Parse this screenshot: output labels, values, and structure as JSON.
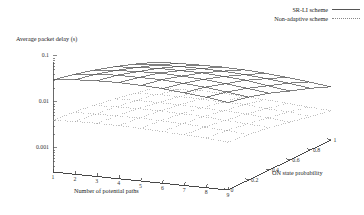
{
  "chart_data": {
    "type": "line",
    "plot_style": "3d-surface-mesh",
    "title": "",
    "zlabel": "Average packet delay (s)",
    "xlabel": "Number of potential paths",
    "ylabel": "ON state probability",
    "zscale": "log",
    "zlim": [
      0.0003,
      0.12
    ],
    "ztick_labels": [
      "0.1",
      "0.01",
      "0.001"
    ],
    "ztick_values": [
      0.1,
      0.01,
      0.001
    ],
    "xtick_labels": [
      "1",
      "2",
      "3",
      "4",
      "5",
      "6",
      "7",
      "8",
      "9"
    ],
    "xtick_values": [
      1,
      2,
      3,
      4,
      5,
      6,
      7,
      8,
      9
    ],
    "ytick_labels": [
      "0",
      "0.2",
      "0.4",
      "0.6",
      "0.8",
      "1"
    ],
    "ytick_values": [
      0,
      0.2,
      0.4,
      0.6,
      0.8,
      1
    ],
    "grid": false,
    "legend_position": "top-right",
    "legend": [
      "SR-LI scheme",
      "Non-adaptive scheme"
    ],
    "x": [
      1,
      2,
      3,
      4,
      5,
      6,
      7,
      8,
      9
    ],
    "y": [
      0,
      0.2,
      0.4,
      0.6,
      0.8,
      1
    ],
    "series": [
      {
        "name": "SR-LI scheme",
        "style": "solid",
        "color": "#555555",
        "z": [
          [
            0.03,
            0.024,
            0.018,
            0.013,
            0.009,
            0.006
          ],
          [
            0.034,
            0.027,
            0.02,
            0.014,
            0.0096,
            0.0063
          ],
          [
            0.036,
            0.029,
            0.021,
            0.015,
            0.01,
            0.0065
          ],
          [
            0.037,
            0.029,
            0.022,
            0.015,
            0.0101,
            0.0066
          ],
          [
            0.036,
            0.029,
            0.021,
            0.015,
            0.0099,
            0.0064
          ],
          [
            0.034,
            0.027,
            0.02,
            0.014,
            0.0093,
            0.006
          ],
          [
            0.031,
            0.025,
            0.018,
            0.013,
            0.0085,
            0.0055
          ],
          [
            0.028,
            0.022,
            0.016,
            0.011,
            0.0076,
            0.0049
          ],
          [
            0.024,
            0.019,
            0.014,
            0.0095,
            0.0066,
            0.0043
          ]
        ]
      },
      {
        "name": "Non-adaptive scheme",
        "style": "dotted",
        "color": "#999999",
        "z": [
          [
            0.004,
            0.0036,
            0.0031,
            0.0026,
            0.0021,
            0.0017
          ],
          [
            0.0042,
            0.0037,
            0.0032,
            0.0027,
            0.0022,
            0.0017
          ],
          [
            0.0043,
            0.0038,
            0.0033,
            0.0027,
            0.0022,
            0.0018
          ],
          [
            0.0043,
            0.0038,
            0.0033,
            0.0027,
            0.0022,
            0.0018
          ],
          [
            0.0042,
            0.0037,
            0.0032,
            0.0026,
            0.0021,
            0.0017
          ],
          [
            0.004,
            0.0036,
            0.0031,
            0.0025,
            0.0021,
            0.0016
          ],
          [
            0.0038,
            0.0034,
            0.0029,
            0.0024,
            0.0019,
            0.0015
          ],
          [
            0.0036,
            0.0032,
            0.0027,
            0.0022,
            0.0018,
            0.0014
          ],
          [
            0.0033,
            0.0029,
            0.0025,
            0.002,
            0.0016,
            0.0013
          ]
        ]
      }
    ]
  },
  "legend": {
    "items": [
      {
        "label": "SR-LI scheme",
        "style": "solid"
      },
      {
        "label": "Non-adaptive scheme",
        "style": "dotted"
      }
    ]
  },
  "axes": {
    "z_title": "Average packet delay (s)",
    "x_title": "Number of potential paths",
    "y_title": "ON state probability"
  }
}
